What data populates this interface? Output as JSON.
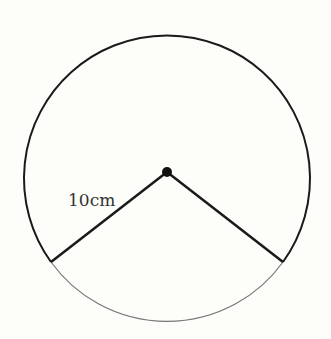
{
  "diagram": {
    "type": "circle-sector",
    "radius_label": "10cm",
    "colors": {
      "background": "#fdfdf9",
      "stroke": "#1a1a1a",
      "minor_arc": "#777777"
    }
  }
}
